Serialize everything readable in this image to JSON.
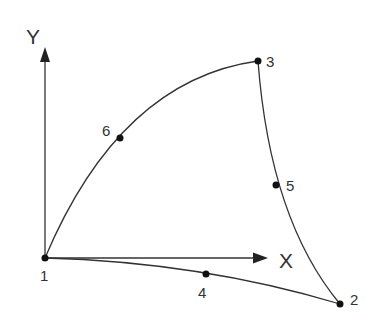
{
  "diagram": {
    "type": "quadratic-triangle-element",
    "stroke_color": "#333333",
    "axes": {
      "x_label": "X",
      "y_label": "Y"
    },
    "nodes": [
      {
        "id": "1",
        "label": "1",
        "x": 45,
        "y": 258
      },
      {
        "id": "2",
        "label": "2",
        "x": 340,
        "y": 304
      },
      {
        "id": "3",
        "label": "3",
        "x": 258,
        "y": 61
      },
      {
        "id": "4",
        "label": "4",
        "x": 206,
        "y": 274
      },
      {
        "id": "5",
        "label": "5",
        "x": 276,
        "y": 185
      },
      {
        "id": "6",
        "label": "6",
        "x": 120,
        "y": 138
      }
    ],
    "edges": [
      {
        "from": "1",
        "mid": "4",
        "to": "2"
      },
      {
        "from": "2",
        "mid": "5",
        "to": "3"
      },
      {
        "from": "3",
        "mid": "6",
        "to": "1"
      }
    ]
  }
}
